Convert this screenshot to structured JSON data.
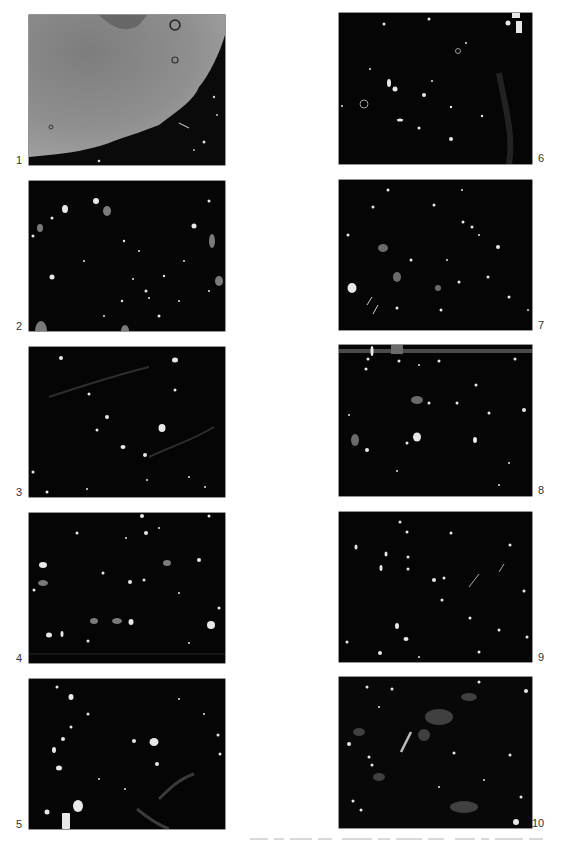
{
  "figure": {
    "panels": [
      {
        "number": "1",
        "column": "left",
        "row": 1,
        "appearance": "large grey clay pellet/inclusion with rounded edge and two circular voids; dark matrix lower right"
      },
      {
        "number": "2",
        "column": "left",
        "row": 2,
        "appearance": "dark groundmass with scattered bright angular inclusions"
      },
      {
        "number": "3",
        "column": "left",
        "row": 3,
        "appearance": "dark groundmass with sparse bright inclusions and faint streaks"
      },
      {
        "number": "4",
        "column": "left",
        "row": 4,
        "appearance": "dark groundmass with abundant fine bright inclusions"
      },
      {
        "number": "5",
        "column": "left",
        "row": 5,
        "appearance": "dark groundmass with bright inclusions; large elongate grain lower left"
      },
      {
        "number": "6",
        "column": "right",
        "row": 1,
        "appearance": "dark groundmass with sparse bright inclusions and a few voids"
      },
      {
        "number": "7",
        "column": "right",
        "row": 2,
        "appearance": "dark groundmass with fine scattered bright inclusions"
      },
      {
        "number": "8",
        "column": "right",
        "row": 3,
        "appearance": "dark groundmass with abundant bright inclusions; grey band at top edge"
      },
      {
        "number": "9",
        "column": "right",
        "row": 4,
        "appearance": "dark groundmass with fine scattered bright inclusions"
      },
      {
        "number": "10",
        "column": "right",
        "row": 5,
        "appearance": "dark groundmass with elongate grains and greyish patches"
      }
    ]
  },
  "colors": {
    "background": "#ffffff",
    "panel_dark": "#050505",
    "panel1_clay": "#8a8a8a",
    "label_text": "#333333"
  }
}
